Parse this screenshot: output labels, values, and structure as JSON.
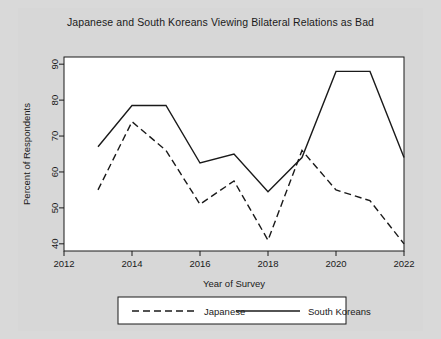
{
  "chart_data": {
    "type": "line",
    "title": "Japanese and South Koreans Viewing Bilateral Relations as Bad",
    "xlabel": "Year of Survey",
    "ylabel": "Percent of Respondents",
    "x": [
      2013,
      2014,
      2015,
      2016,
      2017,
      2018,
      2019,
      2020,
      2021,
      2022
    ],
    "xlim": [
      2012,
      2022
    ],
    "ylim": [
      38,
      92
    ],
    "xticks": [
      2012,
      2014,
      2016,
      2018,
      2020,
      2022
    ],
    "yticks": [
      40,
      50,
      60,
      70,
      80,
      90
    ],
    "grid": false,
    "legend_position": "bottom",
    "series": [
      {
        "name": "Japanese",
        "style": "dashed",
        "color": "#1a1a1a",
        "values": [
          55,
          74,
          66,
          51,
          57.5,
          41,
          66,
          55,
          52,
          40
        ]
      },
      {
        "name": "South Koreans",
        "style": "solid",
        "color": "#1a1a1a",
        "values": [
          67,
          78.5,
          78.5,
          62.5,
          65,
          54.5,
          64,
          88,
          88,
          64
        ]
      }
    ]
  },
  "legend": {
    "items": [
      {
        "label": "Japanese",
        "style": "dashed"
      },
      {
        "label": "South Koreans",
        "style": "solid"
      }
    ]
  },
  "colors": {
    "page_background": "#d7d7d7",
    "plot_background": "#ffffff",
    "axis": "#1a1a1a",
    "line": "#1a1a1a"
  }
}
